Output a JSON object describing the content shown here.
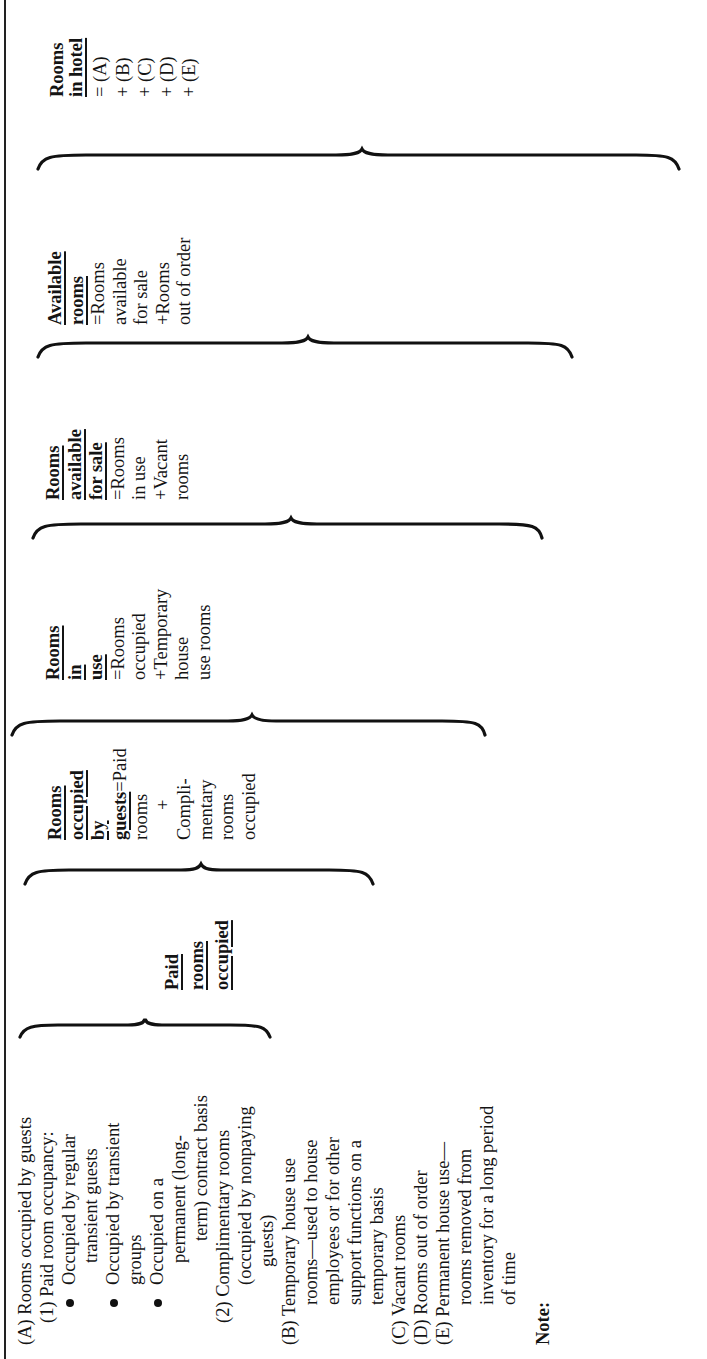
{
  "document": {
    "orientation": "rotated-90-ccw",
    "definitions": [
      {
        "id": "paid-rooms-occupied",
        "heading_lines": [
          "Paid",
          "rooms",
          "occupied"
        ],
        "body_lines": []
      },
      {
        "id": "rooms-occupied-by-guests",
        "heading_lines": [
          "Rooms",
          "occupied",
          "by",
          "guests"
        ],
        "body_lines": [
          "=Paid",
          "rooms",
          "+",
          "Compli-",
          "mentary",
          "rooms",
          "occupied"
        ]
      },
      {
        "id": "rooms-in-use",
        "heading_lines": [
          "Rooms",
          "in",
          "use"
        ],
        "body_lines": [
          "=Rooms",
          "occupied",
          "+Temporary",
          "house",
          "use rooms"
        ]
      },
      {
        "id": "rooms-available-for-sale",
        "heading_lines": [
          "Rooms",
          "available",
          "for sale"
        ],
        "body_lines": [
          "=Rooms",
          "in use",
          "+Vacant",
          "rooms"
        ]
      },
      {
        "id": "available-rooms",
        "heading_lines": [
          "Available",
          "rooms"
        ],
        "body_lines": [
          "=Rooms",
          "available",
          "for sale",
          "+Rooms",
          "out of order"
        ]
      },
      {
        "id": "rooms-in-hotel",
        "heading_lines": [
          "Rooms",
          "in hotel"
        ],
        "heading_underline_partial": "hotel",
        "body_lines": [
          "= (A)",
          "+ (B)",
          "+ (C)",
          "+ (D)",
          "+ (E)"
        ]
      }
    ],
    "categories": [
      {
        "type": "item",
        "text": "(A) Rooms occupied by guests",
        "indent": 0
      },
      {
        "type": "item",
        "text": "(1)  Paid room occupancy:",
        "indent": 1
      },
      {
        "type": "bullet",
        "text": "Occupied by regular",
        "indent": 2
      },
      {
        "type": "cont",
        "text": "transient guests",
        "indent": 3
      },
      {
        "type": "bullet",
        "text": "Occupied by transient",
        "indent": 2
      },
      {
        "type": "cont",
        "text": "groups",
        "indent": 3
      },
      {
        "type": "bullet",
        "text": "Occupied on a",
        "indent": 2
      },
      {
        "type": "cont",
        "text": "permanent (long-",
        "indent": 4
      },
      {
        "type": "cont",
        "text": "term) contract basis",
        "indent": 4
      },
      {
        "type": "item",
        "text": "(2)  Complimentary rooms",
        "indent": 1
      },
      {
        "type": "cont",
        "text": "(occupied by nonpaying",
        "indent": 5
      },
      {
        "type": "cont",
        "text": "guests)",
        "indent": 6
      },
      {
        "type": "item",
        "text": "(B) Temporary house use",
        "indent": 0
      },
      {
        "type": "cont",
        "text": "rooms—used to house",
        "indent": 7
      },
      {
        "type": "cont",
        "text": "employees or for other",
        "indent": 7
      },
      {
        "type": "cont",
        "text": "support functions on a",
        "indent": 7
      },
      {
        "type": "cont",
        "text": "temporary basis",
        "indent": 7
      },
      {
        "type": "item",
        "text": "(C) Vacant rooms",
        "indent": 0
      },
      {
        "type": "item",
        "text": "(D) Rooms out of order",
        "indent": 0
      },
      {
        "type": "item",
        "text": "(E) Permanent house use—",
        "indent": 0
      },
      {
        "type": "cont",
        "text": "rooms removed from",
        "indent": 7
      },
      {
        "type": "cont",
        "text": "inventory for a long period",
        "indent": 7
      },
      {
        "type": "cont",
        "text": "of time",
        "indent": 7
      }
    ],
    "note_label": "Note:"
  }
}
